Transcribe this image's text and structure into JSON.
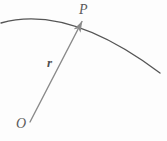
{
  "figure": {
    "type": "vector-position-diagram",
    "background_color": "#fdfdfd",
    "labels": {
      "point_p": "P",
      "vector_r": "r",
      "origin_o": "O"
    },
    "elements": {
      "curve": {
        "name": "trajectory-arc",
        "color": "#555555",
        "stroke_width": 1.3,
        "start": [
          1,
          23
        ],
        "control": [
          70,
          5
        ],
        "end": [
          160,
          73
        ]
      },
      "vector": {
        "name": "position-vector-r",
        "color": "#8a8a8a",
        "stroke_width": 1.4,
        "tail": [
          30,
          122
        ],
        "tip": [
          83,
          20
        ],
        "arrowhead_length": 11,
        "arrowhead_width": 7
      },
      "point_marker": {
        "name": "point-p-marker",
        "position": [
          83,
          20
        ]
      }
    }
  }
}
